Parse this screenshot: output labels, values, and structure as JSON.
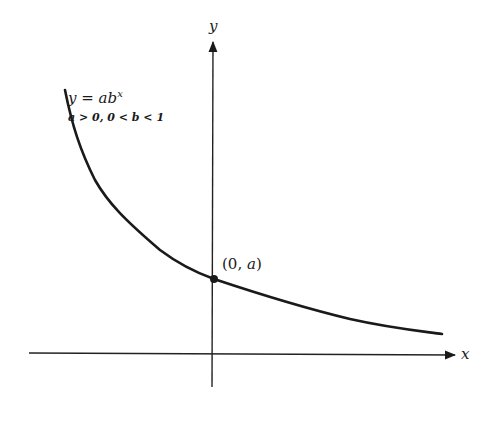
{
  "diagram": {
    "equation": {
      "lhs": "y = ab",
      "exponent": "x"
    },
    "conditions": "a > 0, 0 < b < 1",
    "point_label": {
      "open": "(0, ",
      "var": "a",
      "close": ")"
    },
    "axes": {
      "x_label": "x",
      "y_label": "y"
    },
    "colors": {
      "ink": "#1a1a1a",
      "background": "#ffffff"
    }
  }
}
